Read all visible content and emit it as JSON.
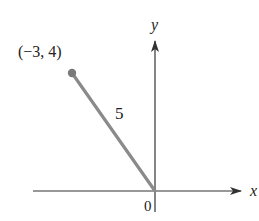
{
  "diagram": {
    "type": "coordinate-vector",
    "axes": {
      "x_label": "x",
      "y_label": "y",
      "origin_label": "0",
      "axis_color": "#333333"
    },
    "point": {
      "label": "(−3, 4)",
      "x": -3,
      "y": 4,
      "color": "#7a7a7a"
    },
    "segment": {
      "length_label": "5",
      "color": "#8a8a8a"
    }
  }
}
